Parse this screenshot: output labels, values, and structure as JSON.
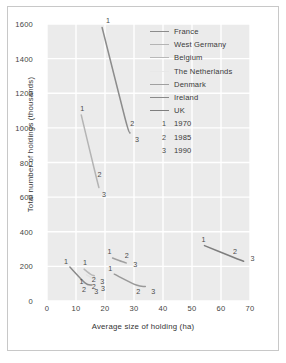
{
  "chart_data": {
    "type": "line",
    "title": "",
    "xlabel": "Average size of holding (ha)",
    "ylabel": "Total number of holdings (thousands)",
    "xlim": [
      0,
      70
    ],
    "ylim": [
      0,
      1600
    ],
    "xticks": [
      "0",
      "10",
      "20",
      "30",
      "40",
      "50",
      "60",
      "70"
    ],
    "yticks": [
      "0",
      "200",
      "400",
      "600",
      "800",
      "1000",
      "1200",
      "1400",
      "1600"
    ],
    "grid": true,
    "legend_position": "upper-right-inside",
    "point_labels": [
      "1",
      "2",
      "3"
    ],
    "point_label_meaning": {
      "1": "1970",
      "2": "1985",
      "3": "1990"
    },
    "series": [
      {
        "name": "France",
        "color": "#8c8c8c",
        "points": [
          {
            "label": "1",
            "x": 19.0,
            "y": 1580
          },
          {
            "label": "2",
            "x": 27.0,
            "y": 1050
          },
          {
            "label": "3",
            "x": 28.6,
            "y": 970
          }
        ]
      },
      {
        "name": "West Germany",
        "color": "#b4b4b4",
        "points": [
          {
            "label": "1",
            "x": 11.8,
            "y": 1075
          },
          {
            "label": "2",
            "x": 16.4,
            "y": 755
          },
          {
            "label": "3",
            "x": 17.9,
            "y": 655
          }
        ]
      },
      {
        "name": "Belgium",
        "color": "#b8b8b8",
        "points": [
          {
            "label": "1",
            "x": 12.8,
            "y": 184
          },
          {
            "label": "2",
            "x": 15.1,
            "y": 154
          },
          {
            "label": "3",
            "x": 16.3,
            "y": 146
          }
        ]
      },
      {
        "name": "The Netherlands",
        "color": "#e2e2e2",
        "points": [
          {
            "label": "1",
            "x": 13.6,
            "y": 151
          },
          {
            "label": "2",
            "x": 15.8,
            "y": 130
          },
          {
            "label": "3",
            "x": 16.9,
            "y": 124
          }
        ]
      },
      {
        "name": "Denmark",
        "color": "#a0a0a0",
        "points": [
          {
            "label": "1",
            "x": 22.6,
            "y": 248
          },
          {
            "label": "2",
            "x": 25.8,
            "y": 228
          },
          {
            "label": "3",
            "x": 27.3,
            "y": 220
          }
        ]
      },
      {
        "name": "Ireland",
        "color": "#8a8a8a",
        "points": [
          {
            "label": "1",
            "x": 7.9,
            "y": 196
          },
          {
            "label": "2",
            "x": 13.1,
            "y": 105
          },
          {
            "label": "3",
            "x": 15.3,
            "y": 92
          }
        ]
      },
      {
        "name": "UK",
        "color": "#7e7e7e",
        "points": [
          {
            "label": "1",
            "x": 54.3,
            "y": 320
          },
          {
            "label": "2",
            "x": 63.8,
            "y": 256
          },
          {
            "label": "3",
            "x": 67.8,
            "y": 230
          }
        ]
      },
      {
        "name": "Denmark-lower",
        "color": "#999999",
        "points": [
          {
            "label": "1",
            "x": 23.2,
            "y": 155
          },
          {
            "label": "2",
            "x": 30.8,
            "y": 92
          },
          {
            "label": "3",
            "x": 33.9,
            "y": 84
          }
        ]
      }
    ]
  },
  "legend": {
    "countries": [
      {
        "label": "France",
        "color": "#8c8c8c"
      },
      {
        "label": "West Germany",
        "color": "#b4b4b4"
      },
      {
        "label": "Belgium",
        "color": "#b8b8b8"
      },
      {
        "label": "The Netherlands",
        "color": "#e8e8e8"
      },
      {
        "label": "Denmark",
        "color": "#a0a0a0"
      },
      {
        "label": "Ireland",
        "color": "#8a8a8a"
      },
      {
        "label": "UK",
        "color": "#7e7e7e"
      }
    ],
    "years": [
      {
        "marker": "1",
        "label": "1970"
      },
      {
        "marker": "2",
        "label": "1985"
      },
      {
        "marker": "3",
        "label": "1990"
      }
    ]
  },
  "colors": {
    "plot_background": "#ebebeb",
    "gridline": "#ffffff",
    "frame": "#c8c8c8",
    "text": "#3a3a3a"
  }
}
